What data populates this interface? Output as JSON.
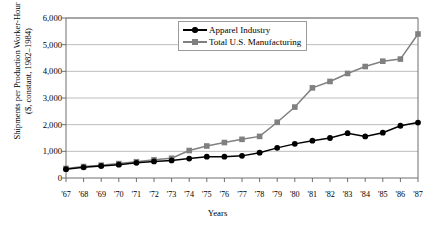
{
  "chart_data": {
    "type": "line",
    "title": "",
    "xlabel": "Years",
    "ylabel": "Shipments per Production Worker-Hour\n($, constant, 1982–1984)",
    "categories": [
      "'67",
      "'68",
      "'69",
      "'70",
      "'71",
      "'72",
      "'73",
      "'74",
      "'75",
      "'76",
      "'77",
      "'78",
      "'79",
      "'80",
      "'81",
      "'82",
      "'83",
      "'84",
      "'85",
      "'86",
      "'87"
    ],
    "x_values": [
      1967,
      1968,
      1969,
      1970,
      1971,
      1972,
      1973,
      1974,
      1975,
      1976,
      1977,
      1978,
      1979,
      1980,
      1981,
      1982,
      1983,
      1984,
      1985,
      1986,
      1987
    ],
    "ylim": [
      0,
      6000
    ],
    "ytick_values": [
      0,
      1000,
      2000,
      3000,
      4000,
      5000,
      6000
    ],
    "ytick_labels": [
      "0",
      "1,000",
      "2,000",
      "3,000",
      "4,000",
      "5,000",
      "6,000"
    ],
    "grid": "horizontal",
    "legend_position": "top-center",
    "series": [
      {
        "name": "Apparel Industry",
        "marker": "circle",
        "color": "#000000",
        "values": [
          330,
          400,
          450,
          500,
          570,
          620,
          660,
          730,
          800,
          800,
          830,
          950,
          1130,
          1280,
          1400,
          1500,
          1680,
          1560,
          1700,
          1960,
          2080
        ]
      },
      {
        "name": "Total U.S. Manufacturing",
        "marker": "square",
        "color": "#808080",
        "values": [
          360,
          430,
          480,
          540,
          610,
          680,
          740,
          1030,
          1200,
          1330,
          1450,
          1560,
          2090,
          2660,
          3380,
          3620,
          3920,
          4180,
          4380,
          4460,
          5400
        ]
      }
    ]
  },
  "legend": {
    "items": [
      {
        "label": "Apparel Industry",
        "marker": "circle",
        "color": "#000000"
      },
      {
        "label": "Total U.S. Manufacturing",
        "marker": "square",
        "color": "#808080"
      }
    ]
  },
  "colors": {
    "apparel": "#000000",
    "manufacturing": "#808080",
    "grid": "#b5b5b5",
    "axis": "#6e6e6e",
    "background": "#ffffff"
  }
}
